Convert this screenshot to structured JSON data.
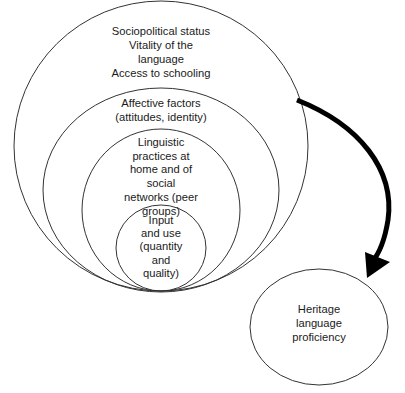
{
  "diagram": {
    "type": "nested-circles-with-arrow",
    "circles": [
      {
        "id": "outer",
        "lines": [
          "Sociopolitical status",
          "Vitality of the",
          "language",
          "Access to schooling"
        ]
      },
      {
        "id": "affective",
        "lines": [
          "Affective factors",
          "(attitudes, identity)"
        ]
      },
      {
        "id": "linguistic",
        "lines": [
          "Linguistic",
          "practices at",
          "home and of",
          "social",
          "networks (peer",
          "groups)"
        ]
      },
      {
        "id": "input",
        "lines": [
          "Input",
          "and use",
          "(quantity",
          "and",
          "quality)"
        ]
      }
    ],
    "outcome": {
      "lines": [
        "Heritage",
        "language",
        "proficiency"
      ]
    },
    "arrow": {
      "from": "outer",
      "to": "outcome",
      "color": "#000000"
    }
  }
}
